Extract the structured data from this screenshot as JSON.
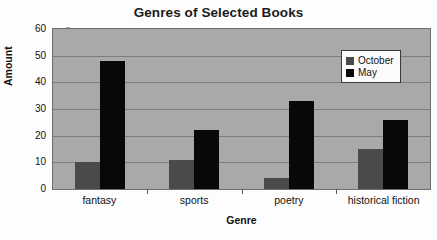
{
  "chart_data": {
    "type": "bar",
    "title": "Genres of Selected Books",
    "xlabel": "Genre",
    "ylabel": "Amount",
    "categories": [
      "fantasy",
      "sports",
      "poetry",
      "historical fiction"
    ],
    "series": [
      {
        "name": "October",
        "color": "#4a4a4a",
        "values": [
          10,
          11,
          4,
          15
        ]
      },
      {
        "name": "May",
        "color": "#080808",
        "values": [
          48,
          22,
          33,
          26
        ]
      }
    ],
    "ylim": [
      0,
      60
    ],
    "yticks": [
      0,
      10,
      20,
      30,
      40,
      50,
      60
    ],
    "ytick_labels": [
      "0",
      "10",
      "20",
      "30",
      "40",
      "50",
      "60"
    ],
    "grid": true,
    "legend_position": "top-right",
    "plot_background": "#a9a9a9",
    "page_background": "#fdfdfd"
  }
}
